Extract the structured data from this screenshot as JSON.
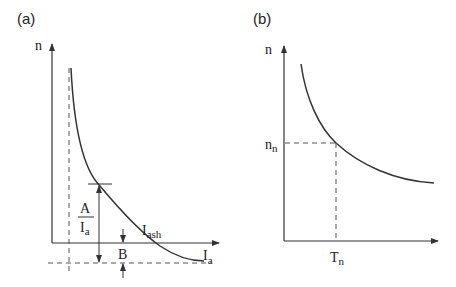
{
  "panels": [
    {
      "id": "a",
      "label": "(a)",
      "y_axis_label": "n",
      "x_axis_label_main": "I",
      "x_axis_label_sub": "a",
      "curve_label_main": "I",
      "curve_label_sub": "ash",
      "fraction_numerator": "A",
      "fraction_denominator_main": "I",
      "fraction_denominator_sub": "a",
      "offset_label": "B"
    },
    {
      "id": "b",
      "label": "(b)",
      "y_axis_label": "n",
      "y_marker_main": "n",
      "y_marker_sub": "n",
      "x_marker_main": "T",
      "x_marker_sub": "n"
    }
  ],
  "colors": {
    "line": "#333333",
    "dashed": "#555555"
  }
}
